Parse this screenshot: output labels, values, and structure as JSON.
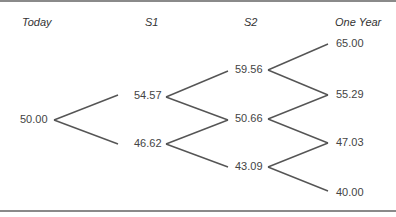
{
  "headers": [
    "Today",
    "S1",
    "S2",
    "One Year"
  ],
  "nodes": {
    "today": "50.00",
    "s1_up": "54.57",
    "s1_down": "46.62",
    "s2_uu": "59.56",
    "s2_ud": "50.66",
    "s2_dd": "43.09",
    "y_uuu": "65.00",
    "y_uud": "55.29",
    "y_udd": "47.03",
    "y_ddd": "40.00"
  },
  "colors": {
    "line": "#555555",
    "text": "#444444",
    "rule": "#8a8a8a"
  }
}
